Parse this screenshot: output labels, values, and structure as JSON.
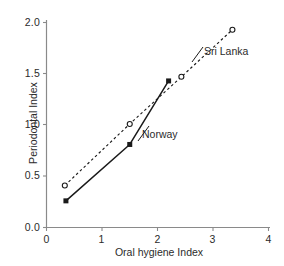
{
  "chart_data": {
    "type": "scatter",
    "title": "",
    "subtitle": "",
    "xlabel": "Oral hygiene Index",
    "ylabel": "Periodontal Index",
    "xlim": [
      0,
      4
    ],
    "ylim": [
      0.0,
      2.0
    ],
    "xticks": [
      0,
      1,
      2,
      3,
      4
    ],
    "xtick_labels": [
      "0",
      "1",
      "2",
      "3",
      "4"
    ],
    "yticks": [
      0.0,
      0.5,
      1.0,
      1.5,
      2.0
    ],
    "ytick_labels": [
      "0.0",
      "0.5",
      "1.0",
      "1.5",
      "2.0"
    ],
    "grid": false,
    "legend_position": "inline-annotation",
    "series": [
      {
        "name": "Sri Lanka",
        "marker": "open-circle",
        "line_style": "dashed",
        "color": "#1a1a1a",
        "points": [
          {
            "x": 0.33,
            "y": 0.41
          },
          {
            "x": 1.5,
            "y": 1.01
          },
          {
            "x": 2.43,
            "y": 1.47
          },
          {
            "x": 3.35,
            "y": 1.93
          }
        ]
      },
      {
        "name": "Norway",
        "marker": "filled-square",
        "line_style": "solid",
        "color": "#1a1a1a",
        "points": [
          {
            "x": 0.35,
            "y": 0.26
          },
          {
            "x": 1.5,
            "y": 0.81
          },
          {
            "x": 2.2,
            "y": 1.43
          }
        ]
      }
    ],
    "annotations": [
      {
        "text": "Sri Lanka",
        "x": 2.85,
        "y": 1.72
      },
      {
        "text": "Norway",
        "x": 1.75,
        "y": 0.96
      }
    ]
  },
  "axes": {
    "x_title": "Oral hygiene Index",
    "y_title": "Periodontal Index",
    "x_tick_labels": [
      "0",
      "1",
      "2",
      "3",
      "4"
    ],
    "y_tick_labels": [
      "0.0",
      "0.5",
      "1.0",
      "1.5",
      "2.0"
    ]
  },
  "labels": {
    "sri_lanka": "Sri Lanka",
    "norway": "Norway"
  },
  "colors": {
    "ink": "#1a1a1a",
    "axis": "#8a8a8a",
    "text": "#2b2b2b",
    "background": "#ffffff"
  }
}
